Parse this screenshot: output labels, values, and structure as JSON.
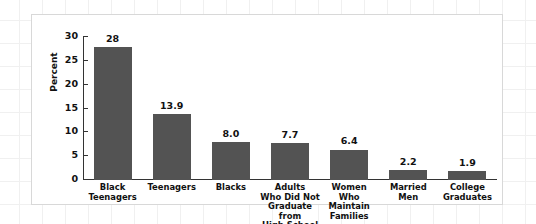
{
  "chart_data": {
    "type": "bar",
    "title": "",
    "subtitle": "",
    "xlabel": "",
    "ylabel": "Percent",
    "ylim": [
      0,
      30
    ],
    "yticks": [
      0,
      5,
      10,
      15,
      20,
      25,
      30
    ],
    "ytick_labels": [
      "0",
      "5",
      "10",
      "15",
      "20",
      "25",
      "30"
    ],
    "grid": false,
    "legend": null,
    "bar_color": "#535353",
    "categories": [
      "Black\nTeenagers",
      "Teenagers",
      "Blacks",
      "Adults\nWho Did Not\nGraduate from\nHigh School",
      "Women\nWho\nMaintain\nFamilies",
      "Married\nMen",
      "College\nGraduates"
    ],
    "values": [
      28,
      13.9,
      8.0,
      7.7,
      6.4,
      2.2,
      1.9
    ],
    "value_labels": [
      "28",
      "13.9",
      "8.0",
      "7.7",
      "6.4",
      "2.2",
      "1.9"
    ]
  },
  "colors": {
    "bar": "#535353",
    "axis": "#333333",
    "text": "#111111",
    "card_background": "#ffffff",
    "card_border": "#d8d8d8",
    "page_grid": "#f0f0f0"
  }
}
